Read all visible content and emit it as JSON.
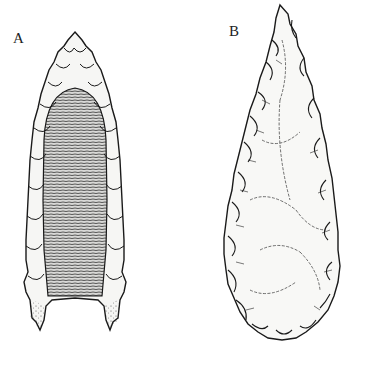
{
  "figure": {
    "labels": {
      "a": "A",
      "b": "B"
    },
    "items": [
      {
        "id": "A",
        "description": "fluted projectile point"
      },
      {
        "id": "B",
        "description": "leaf-shaped projectile point"
      }
    ],
    "colors": {
      "background": "#ffffff",
      "ink": "#1a1a1a"
    }
  }
}
